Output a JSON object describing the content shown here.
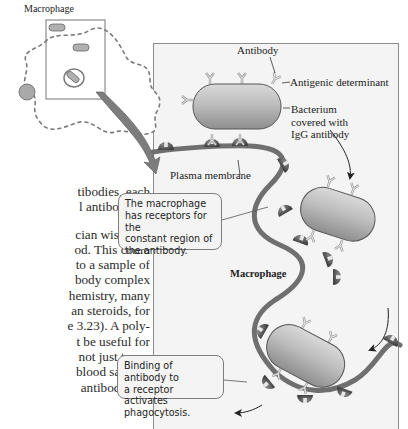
{
  "figure": {
    "inset_title": "Macrophage",
    "labels": {
      "antibody": "Antibody",
      "antigenic_determinant": "Antigenic determinant",
      "bacterium": [
        "Bacterium",
        "covered with",
        "IgG antibody"
      ],
      "plasma_membrane": "Plasma membrane",
      "macrophage": "Macrophage"
    },
    "callouts": [
      {
        "lines": [
          "The macrophage",
          "has receptors for the",
          "constant region of",
          "the antibody."
        ]
      },
      {
        "lines": [
          "Binding of antibody to",
          "a receptor activates",
          "phagocytosis."
        ]
      }
    ],
    "colors": {
      "panel_bg": "#f4f4f4",
      "membrane": "#6f6f6f",
      "bacterium": "#b9b9b9",
      "receptor": "#5c5c5c",
      "antibody": "#d8d8d8",
      "inset_arrow": "#7d7d7d"
    }
  },
  "body_text": {
    "lines": [
      "tibodies, each",
      "l antibody re-",
      "",
      "cian wishes to",
      "od. This could",
      "to a sample of",
      "body complex",
      "hemistry, many",
      "an steroids, for",
      "e 3.23). A poly-",
      "t be useful for",
      "not just to es-",
      "blood sample.",
      "antibody that"
    ]
  }
}
